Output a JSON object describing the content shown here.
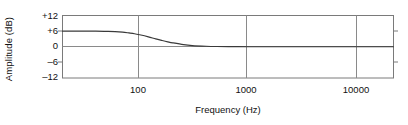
{
  "chart_data": {
    "type": "line",
    "title": "",
    "subtitle": "",
    "xlabel": "Frequency (Hz)",
    "ylabel": "Amplitude (dB)",
    "xscale": "log",
    "xlim": [
      20,
      20000
    ],
    "ylim": [
      -12,
      12
    ],
    "xticks": [
      100,
      1000,
      10000
    ],
    "xtick_labels": [
      "100",
      "1000",
      "10000"
    ],
    "yticks": [
      12,
      6,
      0,
      -6,
      -12
    ],
    "ytick_labels": [
      "+12",
      "+6",
      "0",
      "–6",
      "–12"
    ],
    "grid": "vertical gridlines at 100, 1000, 10000; horizontal gridlines at +6 and 0 dB",
    "grid_on": true,
    "legend": null,
    "legend_position": "none",
    "annotations": [],
    "series": [
      {
        "name": "Low-frequency shelf response",
        "x": [
          20,
          30,
          40,
          50,
          60,
          70,
          80,
          90,
          100,
          120,
          140,
          160,
          180,
          200,
          250,
          300,
          400,
          500,
          700,
          1000,
          2000,
          5000,
          10000,
          20000
        ],
        "y": [
          6.0,
          6.0,
          6.0,
          5.9,
          5.8,
          5.6,
          5.3,
          5.0,
          4.6,
          3.8,
          3.0,
          2.4,
          1.9,
          1.5,
          0.8,
          0.45,
          0.2,
          0.1,
          0.05,
          0.0,
          0.0,
          0.0,
          0.0,
          0.0
        ]
      }
    ]
  },
  "axes": {
    "y_title": "Amplitude (dB)",
    "x_title": "Frequency (Hz)",
    "y_tick_labels": [
      "+12",
      "+6",
      "0",
      "–6",
      "–12"
    ],
    "x_tick_labels": [
      "100",
      "1000",
      "10000"
    ]
  },
  "colors": {
    "curve": "#3a3a3a",
    "axis": "#7a7a7a",
    "grid": "#8a8a8a",
    "text": "#111111",
    "background": "#ffffff"
  }
}
